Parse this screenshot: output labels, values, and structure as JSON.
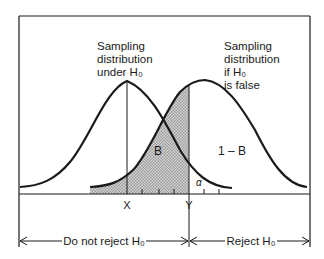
{
  "diagram": {
    "labels": {
      "null_distribution": [
        "Sampling",
        "distribution",
        "under H₀"
      ],
      "alt_distribution": [
        "Sampling",
        "distribution",
        "if H₀",
        "is false"
      ],
      "beta_region": "B",
      "power_region": "1 – B",
      "alpha_region": "α",
      "x_marker": "X",
      "y_marker": "Y",
      "do_not_reject": "Do not reject H₀",
      "reject": "Reject H₀"
    },
    "colors": {
      "line": "#1a1a1a",
      "shade": "#b8b8b8",
      "background": "#ffffff"
    }
  }
}
